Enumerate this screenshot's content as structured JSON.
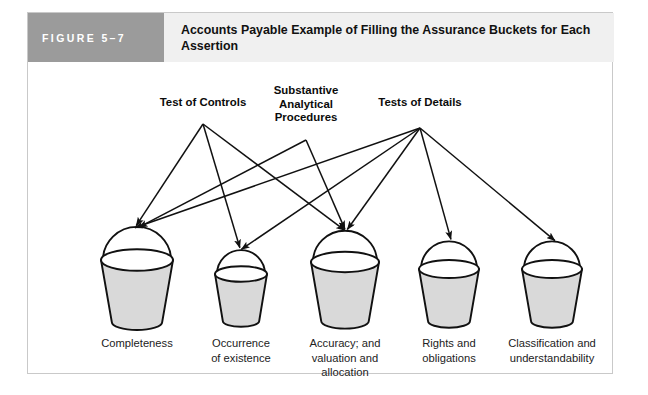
{
  "figure": {
    "number_label": "FIGURE 5–7",
    "title": "Accounts Payable Example of Filling the Assurance Buckets for Each Assertion",
    "header_bg": "#9b9b9b",
    "title_bg": "#f0f0f0",
    "frame_border": "#c9c9c9"
  },
  "diagram": {
    "type": "flow-arrows",
    "line_color": "#111111",
    "bucket_fill": "#d9d9d9",
    "bucket_stroke": "#111111",
    "sources": [
      {
        "id": "test-of-controls",
        "label": "Test of Controls",
        "origin": {
          "x": 175,
          "y": 62
        },
        "targets": [
          "completeness",
          "occurrence-of-existence",
          "accuracy-valuation-allocation"
        ]
      },
      {
        "id": "substantive-analytical-procedures",
        "label": "Substantive\nAnalytical\nProcedures",
        "origin": {
          "x": 278,
          "y": 78
        },
        "targets": [
          "completeness",
          "accuracy-valuation-allocation"
        ]
      },
      {
        "id": "tests-of-details",
        "label": "Tests of Details",
        "origin": {
          "x": 392,
          "y": 66
        },
        "targets": [
          "completeness",
          "occurrence-of-existence",
          "accuracy-valuation-allocation",
          "rights-and-obligations",
          "classification-and-understandability"
        ]
      }
    ],
    "buckets": [
      {
        "id": "completeness",
        "label": "Completeness",
        "center_x": 109,
        "rim_y": 198,
        "rim_rx": 36,
        "height": 62,
        "arrows_received": 3
      },
      {
        "id": "occurrence-of-existence",
        "label": "Occurrence\nof existence",
        "center_x": 213,
        "rim_y": 212,
        "rim_rx": 26,
        "height": 47,
        "arrows_received": 2
      },
      {
        "id": "accuracy-valuation-allocation",
        "label": "Accuracy; and\nvaluation and\nallocation",
        "center_x": 317,
        "rim_y": 200,
        "rim_rx": 34,
        "height": 59,
        "arrows_received": 3
      },
      {
        "id": "rights-and-obligations",
        "label": "Rights and\nobligations",
        "center_x": 421,
        "rim_y": 207,
        "rim_rx": 30,
        "height": 52,
        "arrows_received": 1
      },
      {
        "id": "classification-and-understandability",
        "label": "Classification and\nunderstandability",
        "center_x": 524,
        "rim_y": 207,
        "rim_rx": 30,
        "height": 52,
        "arrows_received": 1
      }
    ]
  }
}
